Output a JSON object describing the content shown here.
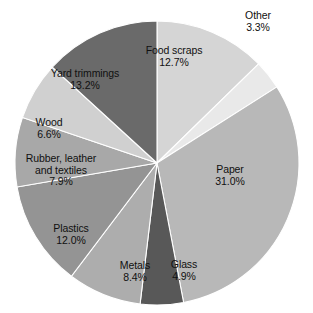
{
  "chart_data": {
    "type": "pie",
    "title": "",
    "subtitle": "",
    "xlabel": "",
    "ylabel": "",
    "legend_position": "none",
    "grid": false,
    "units": "percent",
    "total": 100.0,
    "categories": [
      "Food scraps",
      "Other",
      "Paper",
      "Glass",
      "Metals",
      "Plastics",
      "Rubber, leather and textiles",
      "Wood",
      "Yard trimmings"
    ],
    "values": [
      12.7,
      3.3,
      31.0,
      4.9,
      8.4,
      12.0,
      7.9,
      6.6,
      13.2
    ],
    "slices": [
      {
        "name": "Food scraps",
        "name_lines": [
          "Food scraps"
        ],
        "value": 12.7,
        "value_label": "12.7%",
        "color": "#d5d5d5",
        "label_x": 174,
        "label_y": 57
      },
      {
        "name": "Other",
        "name_lines": [
          "Other"
        ],
        "value": 3.3,
        "value_label": "3.3%",
        "color": "#e9e9e9",
        "label_x": 258,
        "label_y": 22
      },
      {
        "name": "Paper",
        "name_lines": [
          "Paper"
        ],
        "value": 31.0,
        "value_label": "31.0%",
        "color": "#b8b8b8",
        "label_x": 230,
        "label_y": 176
      },
      {
        "name": "Glass",
        "name_lines": [
          "Glass"
        ],
        "value": 4.9,
        "value_label": "4.9%",
        "color": "#585858",
        "label_x": 184,
        "label_y": 271
      },
      {
        "name": "Metals",
        "name_lines": [
          "Metals"
        ],
        "value": 8.4,
        "value_label": "8.4%",
        "color": "#adadad",
        "label_x": 135,
        "label_y": 272
      },
      {
        "name": "Plastics",
        "name_lines": [
          "Plastics"
        ],
        "value": 12.0,
        "value_label": "12.0%",
        "color": "#949494",
        "label_x": 71,
        "label_y": 235
      },
      {
        "name": "Rubber, leather and textiles",
        "name_lines": [
          "Rubber, leather",
          "and textiles"
        ],
        "value": 7.9,
        "value_label": "7.9%",
        "color": "#a8a8a8",
        "label_x": 61,
        "label_y": 170
      },
      {
        "name": "Wood",
        "name_lines": [
          "Wood"
        ],
        "value": 6.6,
        "value_label": "6.6%",
        "color": "#d0d0d0",
        "label_x": 49,
        "label_y": 129
      },
      {
        "name": "Yard trimmings",
        "name_lines": [
          "Yard trimmings"
        ],
        "value": 13.2,
        "value_label": "13.2%",
        "color": "#6a6a6a",
        "label_x": 85,
        "label_y": 80
      }
    ],
    "geometry": {
      "center_x": 157,
      "center_y": 163,
      "radius": 142,
      "start_angle_deg": -90,
      "direction": "clockwise"
    }
  }
}
